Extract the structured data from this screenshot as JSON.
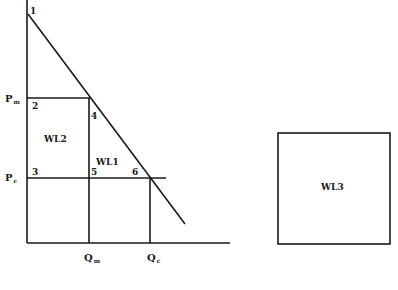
{
  "diagram": {
    "points": {
      "p1": "1",
      "p2": "2",
      "p3": "3",
      "p4": "4",
      "p5": "5",
      "p6": "6"
    },
    "regions": {
      "wl1": "WL1",
      "wl2": "WL2",
      "wl3": "WL3"
    },
    "axis_labels": {
      "pm": "P",
      "pm_sub": "m",
      "pc": "P",
      "pc_sub": "c",
      "qm": "Q",
      "qm_sub": "m",
      "qc": "Q",
      "qc_sub": "c"
    }
  }
}
